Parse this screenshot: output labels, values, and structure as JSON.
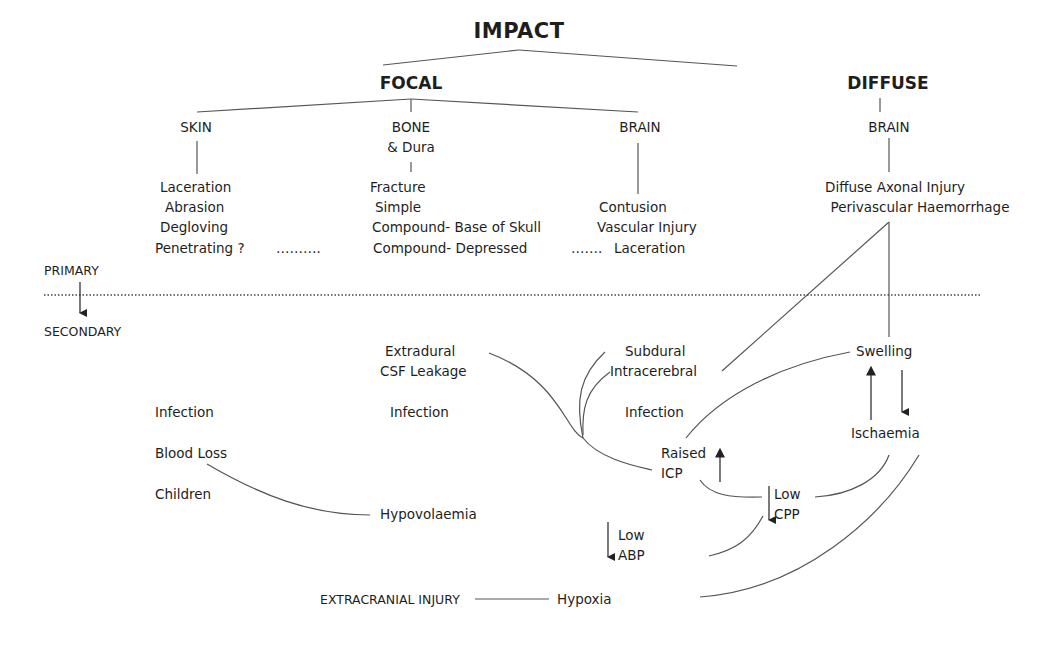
{
  "title": "IMPACT",
  "categories": {
    "focal": "FOCAL",
    "diffuse": "DIFFUSE"
  },
  "focal": {
    "skin": {
      "heading": "SKIN",
      "items": [
        "Laceration",
        "Abrasion",
        "Degloving",
        "Penetrating ?"
      ],
      "ellipsis": "………."
    },
    "bone": {
      "heading_line1": "BONE",
      "heading_line2": "& Dura",
      "items": [
        "Fracture",
        "Simple",
        "Compound- Base of Skull",
        "Compound- Depressed"
      ],
      "ellipsis": "……."
    },
    "brain": {
      "heading": "BRAIN",
      "items": [
        "Contusion",
        "Vascular Injury",
        "Laceration"
      ]
    }
  },
  "diffuse": {
    "brain": {
      "heading": "BRAIN",
      "items": [
        "Diffuse Axonal Injury",
        "Perivascular Haemorrhage"
      ]
    }
  },
  "phases": {
    "primary": "PRIMARY",
    "secondary": "SECONDARY"
  },
  "secondary": {
    "skin_col": [
      "Infection",
      "Blood Loss",
      "Children"
    ],
    "bone_col": {
      "extradural": "Extradural",
      "csf": "CSF Leakage",
      "infection": "Infection"
    },
    "brain_col": {
      "subdural": "Subdural",
      "intracerebral": "Intracerebral",
      "infection": "Infection"
    },
    "swelling": "Swelling",
    "ischaemia": "Ischaemia",
    "raised_icp": [
      "Raised",
      "ICP"
    ],
    "low_cpp": [
      "Low",
      "CPP"
    ],
    "low_abp": [
      "Low",
      "ABP"
    ],
    "hypovolaemia": "Hypovolaemia",
    "extracranial": "EXTRACRANIAL INJURY",
    "hypoxia": "Hypoxia"
  },
  "colors": {
    "text": "#1e1e1e",
    "line": "#555555",
    "background": "#ffffff"
  }
}
